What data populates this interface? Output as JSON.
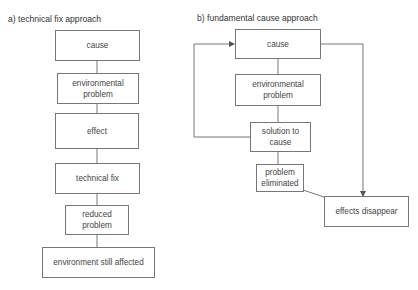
{
  "diagram_a": {
    "title": "a) technical fix approach",
    "boxes": [
      {
        "id": "cause",
        "label": "cause"
      },
      {
        "id": "env_problem",
        "label": "environmental problem"
      },
      {
        "id": "effect",
        "label": "effect"
      },
      {
        "id": "technical_fix",
        "label": "technical fix"
      },
      {
        "id": "reduced_problem",
        "label": "reduced problem"
      },
      {
        "id": "env_still_affected",
        "label": "environment still affected"
      }
    ]
  },
  "diagram_b": {
    "title": "b) fundamental cause approach",
    "boxes": [
      {
        "id": "cause",
        "label": "cause"
      },
      {
        "id": "env_problem",
        "label": "environmental problem"
      },
      {
        "id": "solution",
        "label": "solution to cause"
      },
      {
        "id": "problem_eliminated",
        "label": "problem eliminated"
      },
      {
        "id": "effects_disappear",
        "label": "effects disappear"
      }
    ]
  },
  "colors": {
    "line": "#777777",
    "text": "#444444"
  }
}
